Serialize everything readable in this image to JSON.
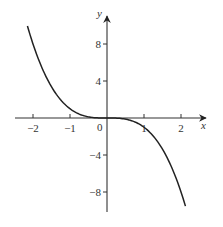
{
  "chart_data": {
    "type": "line",
    "title": "",
    "function": "y = -x^3",
    "xlabel": "x",
    "ylabel": "y",
    "xlim": [
      -2.5,
      2.5
    ],
    "ylim": [
      -10,
      10.5
    ],
    "grid": false,
    "legend": null,
    "x_ticks": [
      -2,
      -1,
      0,
      1,
      2
    ],
    "x_tick_labels": [
      "−2",
      "−1",
      "0",
      "1",
      "2"
    ],
    "y_ticks": [
      8,
      4,
      -4,
      -8
    ],
    "y_tick_labels": [
      "8",
      "4",
      "−4",
      "−8"
    ],
    "origin_label": "0",
    "series": [
      {
        "name": "y = -x^3",
        "x": [
          -2.15,
          -2,
          -1.5,
          -1,
          -0.5,
          0,
          0.5,
          1,
          1.5,
          2,
          2.12
        ],
        "y": [
          9.94,
          8,
          3.375,
          1,
          0.125,
          0,
          -0.125,
          -1,
          -3.375,
          -8,
          -9.53
        ]
      }
    ]
  },
  "axes": {
    "x_label": "x",
    "y_label": "y"
  }
}
